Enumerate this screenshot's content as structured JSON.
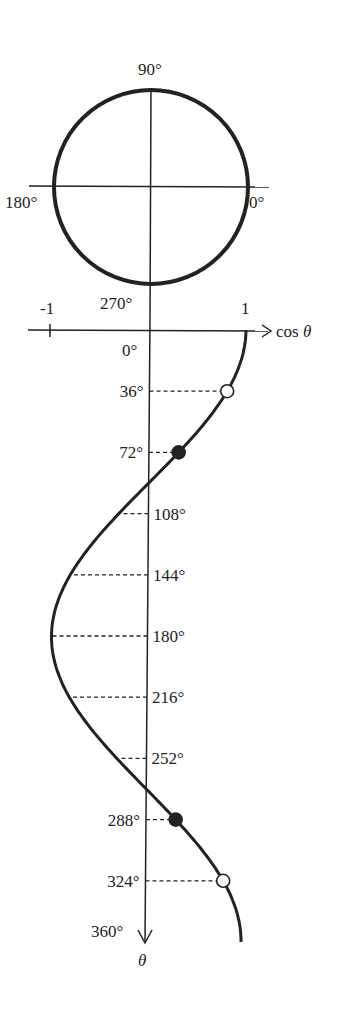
{
  "circle": {
    "labels": {
      "top": "90°",
      "left": "180°",
      "right": "0°",
      "bottom": "270°"
    }
  },
  "axis": {
    "x_label": "cos θ",
    "x_ticks": [
      "-1",
      "1"
    ],
    "y_label": "θ",
    "origin_label": "0°",
    "end_label": "360°"
  },
  "points": [
    {
      "angle": 36,
      "label": "36°",
      "marker": "open",
      "label_side": "left"
    },
    {
      "angle": 72,
      "label": "72°",
      "marker": "filled",
      "label_side": "left"
    },
    {
      "angle": 108,
      "label": "108°",
      "marker": "none",
      "label_side": "right"
    },
    {
      "angle": 144,
      "label": "144°",
      "marker": "none",
      "label_side": "right"
    },
    {
      "angle": 180,
      "label": "180°",
      "marker": "none",
      "label_side": "right"
    },
    {
      "angle": 216,
      "label": "216°",
      "marker": "none",
      "label_side": "right"
    },
    {
      "angle": 252,
      "label": "252°",
      "marker": "none",
      "label_side": "right"
    },
    {
      "angle": 288,
      "label": "288°",
      "marker": "filled",
      "label_side": "left"
    },
    {
      "angle": 324,
      "label": "324°",
      "marker": "open",
      "label_side": "left"
    }
  ],
  "colors": {
    "ink": "#222222",
    "background": "#ffffff"
  }
}
